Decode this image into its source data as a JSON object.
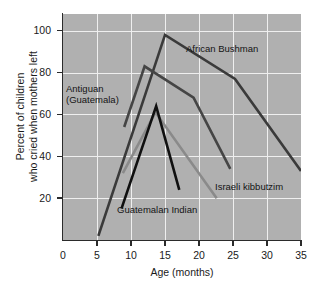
{
  "chart_data": {
    "type": "line",
    "title": "",
    "xlabel": "Age (months)",
    "ylabel_line1": "Percent of children",
    "ylabel_line2": "who cried when mothers left",
    "xlim": [
      0,
      35
    ],
    "ylim": [
      0,
      108
    ],
    "xticks": [
      0,
      5,
      10,
      15,
      20,
      25,
      30,
      35
    ],
    "yticks": [
      20,
      40,
      60,
      80,
      100
    ],
    "grid": true,
    "grid_color": "#efefef",
    "plot_background": "#b0b0b0",
    "legend_position": "inline-annotations",
    "series": [
      {
        "name": "African Bushman",
        "color": "#3a3a3a",
        "x": [
          5.2,
          15.0,
          25.3,
          35.0
        ],
        "y": [
          2,
          98,
          77,
          33
        ]
      },
      {
        "name": "Antiguan (Guatemala)",
        "color": "#454545",
        "x": [
          9.0,
          12.0,
          19.2,
          24.6
        ],
        "y": [
          54,
          83,
          68,
          34
        ]
      },
      {
        "name": "Israeli kibbutzim",
        "color": "#8a8a8a",
        "x": [
          8.8,
          13.6,
          22.6
        ],
        "y": [
          32,
          61,
          20
        ]
      },
      {
        "name": "Guatemalan Indian",
        "color": "#101010",
        "x": [
          8.6,
          13.7,
          17.1
        ],
        "y": [
          15,
          64,
          24
        ]
      }
    ],
    "annotations": [
      {
        "key": "bushman",
        "text": "African Bushman"
      },
      {
        "key": "antiguan_l1",
        "text": "Antiguan"
      },
      {
        "key": "antiguan_l2",
        "text": "(Guatemala)"
      },
      {
        "key": "israeli",
        "text": "Israeli kibbutzim"
      },
      {
        "key": "guatemalan",
        "text": "Guatemalan Indian"
      }
    ],
    "xtick_labels": [
      "0",
      "5",
      "10",
      "15",
      "20",
      "25",
      "30",
      "35"
    ],
    "ytick_labels": [
      "20",
      "40",
      "60",
      "80",
      "100"
    ]
  }
}
